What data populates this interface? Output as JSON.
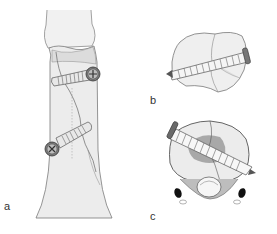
{
  "figure": {
    "panels": [
      {
        "id": "a",
        "label": "a",
        "view": "anterior view of bone with two screws across oblique fracture"
      },
      {
        "id": "b",
        "label": "b",
        "view": "cross-section with screw across fracture (upper)"
      },
      {
        "id": "c",
        "label": "c",
        "view": "cross-section with screw across fracture (lower) with surrounding structures"
      }
    ],
    "colors": {
      "bone_fill": "#ececec",
      "outline": "#555555",
      "screw_head": "#6a6a6a",
      "shading": "#c4c4c4",
      "dark": "#1a1a1a"
    }
  }
}
